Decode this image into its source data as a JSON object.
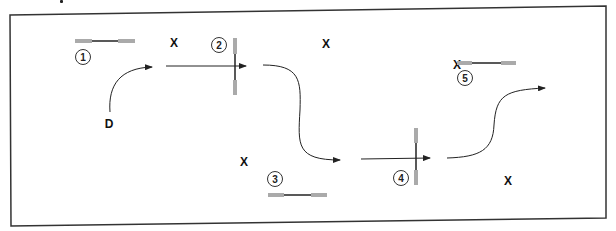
{
  "diagram": {
    "title": "",
    "frame": {
      "stroke": "#333333"
    },
    "colors": {
      "line": "#222222",
      "grip": "#aaaaaa",
      "frame": "#333333",
      "text": "#111111"
    },
    "start_label": "D",
    "x_marks": [
      "X",
      "X",
      "X",
      "X",
      "X"
    ],
    "specimens": [
      {
        "number": "1",
        "orientation": "horizontal"
      },
      {
        "number": "2",
        "orientation": "vertical"
      },
      {
        "number": "3",
        "orientation": "horizontal"
      },
      {
        "number": "4",
        "orientation": "vertical"
      },
      {
        "number": "5",
        "orientation": "horizontal"
      }
    ],
    "arrows": [
      {
        "from": "D",
        "to": "segment-1",
        "shape": "curve"
      },
      {
        "from": "segment-1",
        "to": "specimen-2",
        "shape": "straight"
      },
      {
        "from": "specimen-2",
        "to": "segment-2",
        "shape": "s-curve"
      },
      {
        "from": "segment-2",
        "to": "specimen-4",
        "shape": "straight"
      },
      {
        "from": "specimen-4",
        "to": "end",
        "shape": "s-curve"
      }
    ]
  }
}
